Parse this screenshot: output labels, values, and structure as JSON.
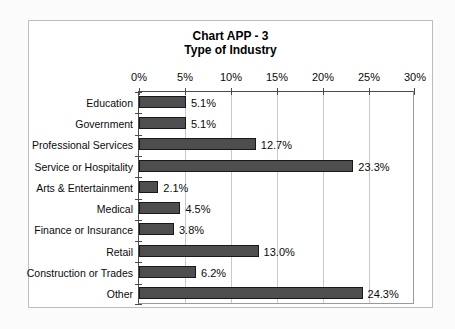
{
  "chart_data": {
    "type": "bar",
    "orientation": "horizontal",
    "title": "Chart APP - 3",
    "subtitle": "Type of Industry",
    "categories": [
      "Education",
      "Government",
      "Professional Services",
      "Service or Hospitality",
      "Arts & Entertainment",
      "Medical",
      "Finance or Insurance",
      "Retail",
      "Construction or Trades",
      "Other"
    ],
    "values": [
      5.1,
      5.1,
      12.7,
      23.3,
      2.1,
      4.5,
      3.8,
      13.0,
      6.2,
      24.3
    ],
    "value_labels": [
      "5.1%",
      "5.1%",
      "12.7%",
      "23.3%",
      "2.1%",
      "4.5%",
      "3.8%",
      "13.0%",
      "6.2%",
      "24.3%"
    ],
    "xlabel": "",
    "ylabel": "",
    "xlim": [
      0,
      30
    ],
    "xticks": [
      "0%",
      "5%",
      "10%",
      "15%",
      "20%",
      "25%",
      "30%"
    ],
    "xtick_values": [
      0,
      5,
      10,
      15,
      20,
      25,
      30
    ],
    "grid": true,
    "legend": false,
    "value_axis_position": "top",
    "bar_color": "#4e4e4e",
    "bar_border_color": "#181818"
  }
}
